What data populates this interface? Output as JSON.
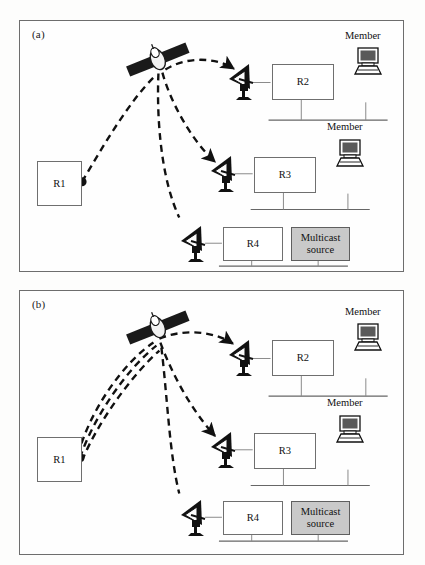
{
  "figure": {
    "background_color": "#fdfdfc",
    "panel_border_color": "#6d6d6d",
    "link_color": "#111111",
    "shaded_fill": "#c9c9c9"
  },
  "panels": [
    {
      "id": "a",
      "label": "(a)",
      "caption_note": "Satellite multicast: single uplink from R1, replicated by satellite into three downlinks",
      "uplink_count": 1,
      "downlink_count": 3,
      "satellite": {
        "name": "satellite-icon"
      },
      "source_router": {
        "label": "R1",
        "name": "router-r1"
      },
      "rows": [
        {
          "router": "R2",
          "dish": "dish-antenna-icon",
          "member_label": "Member",
          "member_icon": "computer-icon",
          "has_bus": true
        },
        {
          "router": "R3",
          "dish": "dish-antenna-icon",
          "member_label": "Member",
          "member_icon": "computer-icon",
          "has_bus": true
        },
        {
          "router": "R4",
          "dish": "dish-antenna-icon",
          "source_box": "Multicast source",
          "has_bus": true
        }
      ]
    },
    {
      "id": "b",
      "label": "(b)",
      "caption_note": "Unicast replication: three separate uplinks from R1, three downlinks from satellite",
      "uplink_count": 3,
      "downlink_count": 3,
      "satellite": {
        "name": "satellite-icon"
      },
      "source_router": {
        "label": "R1",
        "name": "router-r1"
      },
      "rows": [
        {
          "router": "R2",
          "dish": "dish-antenna-icon",
          "member_label": "Member",
          "member_icon": "computer-icon",
          "has_bus": true
        },
        {
          "router": "R3",
          "dish": "dish-antenna-icon",
          "member_label": "Member",
          "member_icon": "computer-icon",
          "has_bus": true
        },
        {
          "router": "R4",
          "dish": "dish-antenna-icon",
          "source_box": "Multicast source",
          "has_bus": true
        }
      ]
    }
  ],
  "labels": {
    "panel_a": "(a)",
    "panel_b": "(b)",
    "r1": "R1",
    "r2": "R2",
    "r3": "R3",
    "r4": "R4",
    "member": "Member",
    "multicast_source": "Multicast source",
    "multicast_source_line1": "Multicast",
    "multicast_source_line2": "source"
  }
}
